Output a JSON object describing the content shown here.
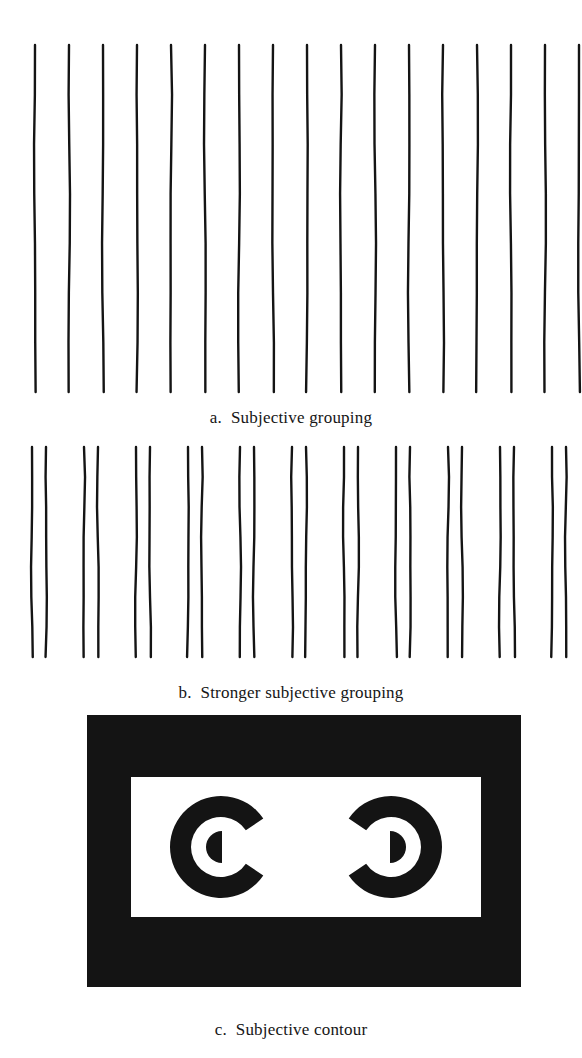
{
  "page": {
    "background_color": "#ffffff",
    "ink_color": "#141414",
    "width": 582,
    "height": 1058,
    "figure_type": "perceptual-grouping-illustration"
  },
  "panels": [
    {
      "id": "a",
      "caption": "a.  Subjective grouping",
      "label": "a.",
      "title": "Subjective grouping",
      "art": {
        "kind": "vertical-line-array",
        "line_count": 17,
        "spacing_px": 34,
        "first_x": 35,
        "top_y": 45,
        "bottom_y": 392,
        "stroke_width": 2.4,
        "grouping": "uniform",
        "description": "Seventeen evenly spaced vertical lines"
      }
    },
    {
      "id": "b",
      "caption": "b.  Stronger subjective grouping",
      "label": "b.",
      "title": "Stronger subjective grouping",
      "art": {
        "kind": "vertical-line-array",
        "line_count": 22,
        "pair_count": 11,
        "pair_gap_px": 14,
        "group_gap_px": 38,
        "first_x": 32,
        "top_y": 12,
        "bottom_y": 222,
        "stroke_width": 2.4,
        "grouping": "paired",
        "description": "Twenty-two vertical lines arranged in eleven close pairs"
      }
    },
    {
      "id": "c",
      "caption": "c.  Subjective contour",
      "label": "c.",
      "title": "Subjective contour",
      "art": {
        "kind": "subjective-contour-figure",
        "outer_rect": {
          "x": 87,
          "y": 4,
          "width": 434,
          "height": 272,
          "fill": "#141414"
        },
        "inner_rect": {
          "x": 131,
          "y": 66,
          "width": 350,
          "height": 140,
          "fill": "#ffffff"
        },
        "left_shape": {
          "name": "c-shape-left",
          "cx": 221,
          "cy": 136,
          "outer_r": 51,
          "inner_r": 30,
          "opening": "right",
          "nub": {
            "cx": 221,
            "cy": 136,
            "r": 16,
            "flat_side": "right"
          }
        },
        "right_shape": {
          "name": "c-shape-right",
          "cx": 391,
          "cy": 136,
          "outer_r": 51,
          "inner_r": 30,
          "opening": "left",
          "nub": {
            "cx": 391,
            "cy": 136,
            "r": 16,
            "flat_side": "left"
          }
        },
        "description": "Black frame with white field containing two facing C shapes that induce an illusory rectangle"
      }
    }
  ]
}
